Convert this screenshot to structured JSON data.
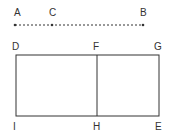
{
  "diagram": {
    "colors": {
      "stroke": "#333333",
      "background": "#ffffff"
    },
    "points": {
      "A": {
        "label": "A",
        "x": 15,
        "y": 25,
        "lx": 14,
        "ly": 16
      },
      "C": {
        "label": "C",
        "x": 52,
        "y": 25,
        "lx": 49,
        "ly": 16
      },
      "B": {
        "label": "B",
        "x": 143,
        "y": 25,
        "lx": 140,
        "ly": 16
      },
      "D": {
        "label": "D",
        "x": 16,
        "y": 55,
        "lx": 12,
        "ly": 50
      },
      "F": {
        "label": "F",
        "x": 97,
        "y": 55,
        "lx": 93,
        "ly": 50
      },
      "G": {
        "label": "G",
        "x": 159,
        "y": 55,
        "lx": 154,
        "ly": 50
      },
      "I": {
        "label": "I",
        "x": 16,
        "y": 116,
        "lx": 13,
        "ly": 130
      },
      "H": {
        "label": "H",
        "x": 97,
        "y": 116,
        "lx": 93,
        "ly": 130
      },
      "E": {
        "label": "E",
        "x": 159,
        "y": 116,
        "lx": 155,
        "ly": 130
      }
    },
    "segments": [
      {
        "name": "segment-ab",
        "from": "A",
        "to": "B",
        "style": "dashed"
      },
      {
        "name": "rect-outline",
        "type": "rect",
        "corners": [
          "D",
          "G",
          "E",
          "I"
        ],
        "style": "solid"
      },
      {
        "name": "segment-fh",
        "from": "F",
        "to": "H",
        "style": "solid"
      }
    ]
  }
}
